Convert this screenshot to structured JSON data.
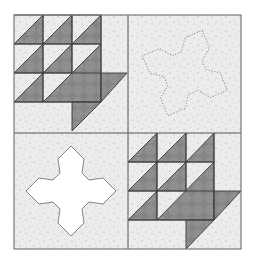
{
  "figure": {
    "grid": {
      "rows": 2,
      "cols": 2
    },
    "blocks": [
      {
        "position": "top-left",
        "type": "basket",
        "label": "Pieced basket block"
      },
      {
        "position": "top-right",
        "type": "flower-outline",
        "label": "Flower appliqué placement outline (dotted)"
      },
      {
        "position": "bottom-left",
        "type": "flower-solid",
        "label": "Flower appliqué (white)"
      },
      {
        "position": "bottom-right",
        "type": "basket",
        "label": "Pieced basket block"
      }
    ]
  },
  "colors": {
    "page_bg": "#ffffff",
    "background_fabric": "#ececec",
    "background_speckle": "#9a9a9a",
    "dark_fabric": "#8a8a8a",
    "dark_swirl": "#a2a2a2",
    "seam_line": "#3c3c3c",
    "border_line": "#6e6e6e",
    "flower_fill": "#ffffff",
    "flower_outline": "#777777",
    "dotted_outline": "#8a8a8a"
  }
}
